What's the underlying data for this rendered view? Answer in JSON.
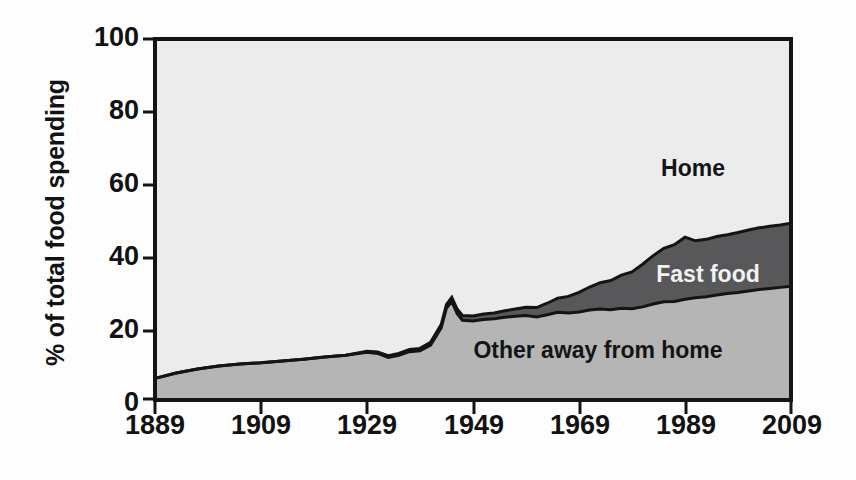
{
  "chart_data": {
    "type": "area",
    "stacked": true,
    "title": "",
    "xlabel": "",
    "ylabel": "% of total food spending",
    "xlim": [
      1889,
      2009
    ],
    "ylim": [
      0,
      100
    ],
    "grid": false,
    "legend_position": "inline-annotations",
    "xticks": [
      "1889",
      "1909",
      "1929",
      "1949",
      "1969",
      "1989",
      "2009"
    ],
    "xtick_values": [
      1889,
      1909,
      1929,
      1949,
      1969,
      1989,
      2009
    ],
    "yticks": [
      "0",
      "20",
      "40",
      "60",
      "80",
      "100"
    ],
    "ytick_values": [
      0,
      20,
      40,
      60,
      80,
      100
    ],
    "annotations": [
      {
        "text": "Home",
        "series": "Home"
      },
      {
        "text": "Fast food",
        "series": "Fast food"
      },
      {
        "text": "Other away from home",
        "series": "Other away from home"
      }
    ],
    "colors": {
      "home": "#ececec",
      "fast_food": "#58585a",
      "other_away_from_home": "#b5b5b5",
      "axis": "#141414",
      "outline": "#141414"
    },
    "x": [
      1889,
      1893,
      1897,
      1901,
      1905,
      1909,
      1913,
      1917,
      1921,
      1925,
      1929,
      1931,
      1933,
      1935,
      1937,
      1939,
      1941,
      1943,
      1944,
      1945,
      1946,
      1947,
      1949,
      1951,
      1953,
      1955,
      1957,
      1959,
      1961,
      1963,
      1965,
      1967,
      1969,
      1971,
      1973,
      1975,
      1977,
      1979,
      1981,
      1983,
      1985,
      1987,
      1989,
      1991,
      1993,
      1995,
      1997,
      1999,
      2001,
      2003,
      2005,
      2007,
      2009
    ],
    "series": [
      {
        "name": "Other away from home",
        "values": [
          6.0,
          7.5,
          8.6,
          9.4,
          10.0,
          10.3,
          10.8,
          11.3,
          11.9,
          12.4,
          13.2,
          12.9,
          11.8,
          12.4,
          13.4,
          13.6,
          15.2,
          20.0,
          25.5,
          27.3,
          24.0,
          22.1,
          21.9,
          22.3,
          22.5,
          22.9,
          23.2,
          23.4,
          23.0,
          23.6,
          24.3,
          24.1,
          24.4,
          24.9,
          25.2,
          25.0,
          25.4,
          25.3,
          25.8,
          26.6,
          27.2,
          27.3,
          27.9,
          28.3,
          28.6,
          29.1,
          29.5,
          29.8,
          30.2,
          30.6,
          30.9,
          31.2,
          31.5
        ]
      },
      {
        "name": "Fast food",
        "values": [
          0.0,
          0.0,
          0.0,
          0.0,
          0.0,
          0.0,
          0.0,
          0.0,
          0.0,
          0.0,
          0.3,
          0.4,
          0.5,
          0.5,
          0.6,
          0.7,
          0.8,
          0.9,
          1.0,
          1.1,
          1.2,
          1.3,
          1.4,
          1.5,
          1.6,
          1.8,
          2.0,
          2.3,
          2.6,
          3.2,
          3.9,
          4.6,
          5.4,
          6.4,
          7.3,
          8.1,
          9.2,
          10.2,
          11.8,
          13.4,
          14.8,
          15.7,
          17.2,
          15.8,
          15.9,
          16.2,
          16.3,
          16.6,
          16.9,
          17.1,
          17.2,
          17.3,
          17.5
        ]
      },
      {
        "name": "Home",
        "values": [
          94.0,
          92.5,
          91.4,
          90.6,
          90.0,
          89.7,
          89.2,
          88.7,
          88.1,
          87.6,
          86.5,
          86.7,
          87.7,
          87.1,
          86.0,
          85.7,
          84.0,
          79.1,
          73.5,
          71.6,
          74.8,
          76.6,
          76.7,
          76.2,
          75.9,
          75.3,
          74.8,
          74.3,
          74.4,
          73.2,
          71.8,
          71.3,
          70.2,
          68.7,
          67.5,
          66.9,
          65.4,
          64.5,
          62.4,
          60.0,
          58.0,
          57.0,
          54.9,
          55.9,
          55.5,
          54.7,
          54.2,
          53.6,
          52.9,
          52.3,
          51.9,
          51.5,
          51.0
        ]
      }
    ]
  },
  "axes": {
    "y_title": "% of total food spending"
  }
}
